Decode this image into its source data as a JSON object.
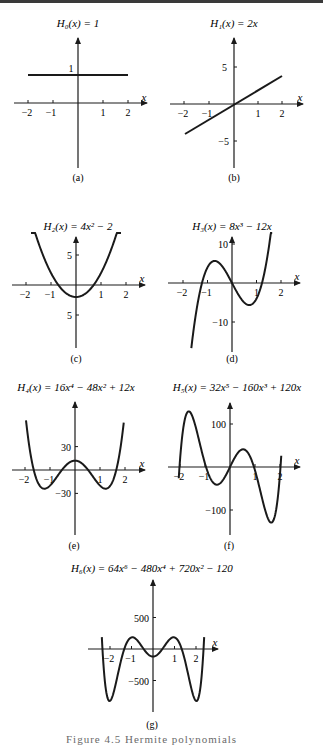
{
  "figure": {
    "caption": "Figure 4.5  Hermite polynomials",
    "panels": [
      {
        "id": "a",
        "label": "(a)",
        "title": "H₀(x) = 1"
      },
      {
        "id": "b",
        "label": "(b)",
        "title": "H₁(x) = 2x"
      },
      {
        "id": "c",
        "label": "(c)",
        "title": "H₂(x) = 4x² − 2"
      },
      {
        "id": "d",
        "label": "(d)",
        "title": "H₃(x) = 8x³ − 12x"
      },
      {
        "id": "e",
        "label": "(e)",
        "title": "H₄(x) = 16x⁴ − 48x² + 12x"
      },
      {
        "id": "f",
        "label": "(f)",
        "title": "H₅(x) = 32x⁵ − 160x³ + 120x"
      },
      {
        "id": "g",
        "label": "(g)",
        "title": "H₆(x) = 64x⁶ − 480x⁴ + 720x² − 120"
      }
    ]
  },
  "chart_data": [
    {
      "type": "line",
      "title": "H0(x) = 1",
      "panel": "(a)",
      "xlabel": "x",
      "ylabel": "",
      "x_ticks": [
        -2,
        -1,
        1,
        2
      ],
      "y_ticks": [
        1
      ],
      "xlim": [
        -2,
        2
      ],
      "series": [
        {
          "name": "H0",
          "x": [
            -2,
            2
          ],
          "y": [
            1,
            1
          ]
        }
      ]
    },
    {
      "type": "line",
      "title": "H1(x) = 2x",
      "panel": "(b)",
      "xlabel": "x",
      "ylabel": "",
      "x_ticks": [
        -2,
        -1,
        1,
        2
      ],
      "y_ticks": [
        5,
        -5
      ],
      "xlim": [
        -2,
        2
      ],
      "series": [
        {
          "name": "H1",
          "x": [
            -2,
            2
          ],
          "y": [
            -4,
            4
          ]
        }
      ]
    },
    {
      "type": "line",
      "title": "H2(x) = 4x^2 - 2",
      "panel": "(c)",
      "xlabel": "x",
      "ylabel": "",
      "x_ticks": [
        -2,
        -1,
        1,
        2
      ],
      "y_ticks": [
        5,
        -5
      ],
      "y_tick_labels": [
        "5",
        "5"
      ],
      "xlim": [
        -1.8,
        1.8
      ],
      "series": [
        {
          "name": "H2",
          "formula": "4x^2-2",
          "x": [
            -1.8,
            -1,
            0,
            1,
            1.8
          ],
          "y": [
            10.96,
            2,
            -2,
            2,
            10.96
          ]
        }
      ]
    },
    {
      "type": "line",
      "title": "H3(x) = 8x^3 - 12x",
      "panel": "(d)",
      "xlabel": "x",
      "ylabel": "",
      "x_ticks": [
        -2,
        -1,
        1,
        2
      ],
      "y_ticks": [
        10,
        -10
      ],
      "xlim": [
        -1.7,
        1.7
      ],
      "series": [
        {
          "name": "H3",
          "formula": "8x^3-12x",
          "x": [
            -1.5,
            -0.71,
            0,
            0.71,
            1.5
          ],
          "y": [
            -9,
            5.66,
            0,
            -5.66,
            9
          ]
        }
      ]
    },
    {
      "type": "line",
      "title": "H4(x) = 16x^4 - 48x^2 + 12x",
      "panel": "(e)",
      "xlabel": "x",
      "ylabel": "",
      "note": "curve drawn is the true H4 = 16x^4 - 48x^2 + 12 (symmetric)",
      "x_ticks": [
        -2,
        -1,
        1,
        2
      ],
      "y_ticks": [
        30,
        -30
      ],
      "xlim": [
        -2,
        2
      ],
      "series": [
        {
          "name": "H4",
          "formula": "16x^4-48x^2+12",
          "x": [
            -2,
            -1.22,
            0,
            1.22,
            2
          ],
          "y": [
            76,
            -24,
            12,
            -24,
            76
          ]
        }
      ]
    },
    {
      "type": "line",
      "title": "H5(x) = 32x^5 - 160x^3 + 120x",
      "panel": "(f)",
      "xlabel": "x",
      "ylabel": "",
      "x_ticks": [
        -2,
        -1,
        1,
        2
      ],
      "y_ticks": [
        100,
        -100
      ],
      "xlim": [
        -2.1,
        2.1
      ],
      "series": [
        {
          "name": "H5",
          "formula": "32x^5-160x^3+120x",
          "x": [
            -1.66,
            -0.62,
            0,
            0.62,
            1.66
          ],
          "y": [
            139,
            -58,
            0,
            58,
            -139
          ]
        }
      ]
    },
    {
      "type": "line",
      "title": "H6(x) = 64x^6 - 480x^4 + 720x^2 - 120",
      "panel": "(g)",
      "xlabel": "x",
      "ylabel": "",
      "x_ticks": [
        -2,
        -1,
        1,
        2
      ],
      "y_ticks": [
        500,
        -500
      ],
      "xlim": [
        -2.4,
        2.4
      ],
      "series": [
        {
          "name": "H6",
          "formula": "64x^6-480x^4+720x^2-120",
          "x": [
            -1.97,
            -1.0,
            0,
            1.0,
            1.97
          ],
          "y": [
            -870,
            184,
            -120,
            184,
            -870
          ]
        }
      ]
    }
  ]
}
